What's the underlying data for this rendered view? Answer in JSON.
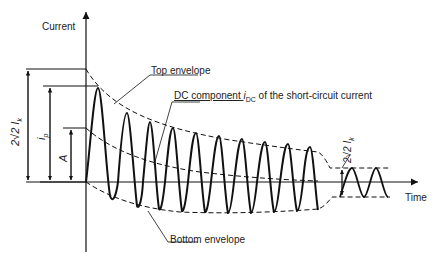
{
  "axes": {
    "y_label": "Current",
    "x_label": "Time"
  },
  "annotations": {
    "top_envelope": "Top envelope",
    "bottom_envelope": "Bottom envelope",
    "dc_component_prefix": "DC component ",
    "dc_component_symbol": "i",
    "dc_component_sub": "DC",
    "dc_component_suffix": " of the short-circuit current"
  },
  "dimension_labels": {
    "peak_to_peak_initial": "2√2 I",
    "peak_to_peak_initial_sub": "k",
    "peak_current": "i",
    "peak_current_sub": "p",
    "dc_initial": "A",
    "steady_state": "2√2 I",
    "steady_state_sub": "k"
  },
  "colors": {
    "line": "#111111",
    "text": "#222222",
    "background": "#ffffff"
  }
}
